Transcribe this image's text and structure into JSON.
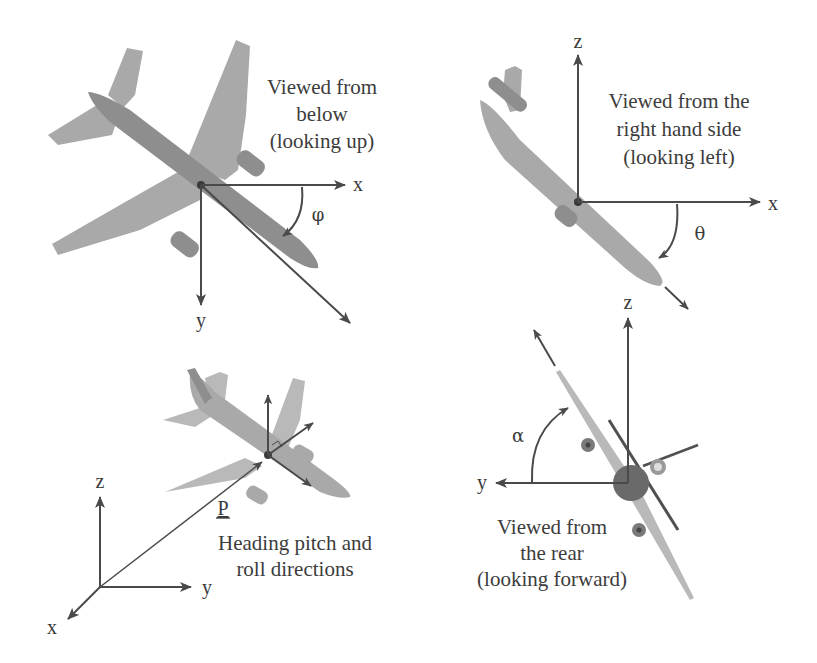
{
  "figure": {
    "colors": {
      "background": "#ffffff",
      "airframe": "#a9a9a9",
      "axis": "#4a4a4a",
      "text": "#3c3c3c"
    }
  },
  "panels": [
    {
      "id": "below",
      "caption_lines": [
        "Viewed from",
        "below",
        "(looking up)"
      ],
      "axes": {
        "horizontal": "x",
        "vertical": "y"
      },
      "angle_symbol": "φ"
    },
    {
      "id": "right-side",
      "caption_lines": [
        "Viewed from the",
        "right hand side",
        "(looking left)"
      ],
      "axes": {
        "horizontal": "x",
        "vertical": "z"
      },
      "angle_symbol": "θ"
    },
    {
      "id": "heading",
      "caption_lines": [
        "Heading pitch and",
        "roll directions"
      ],
      "axes": {
        "x": "x",
        "y": "y",
        "z": "z"
      },
      "position_vector": "P"
    },
    {
      "id": "rear",
      "caption_lines": [
        "Viewed from",
        "the rear",
        "(looking forward)"
      ],
      "axes": {
        "horizontal": "y",
        "vertical": "z"
      },
      "angle_symbol": "α"
    }
  ]
}
